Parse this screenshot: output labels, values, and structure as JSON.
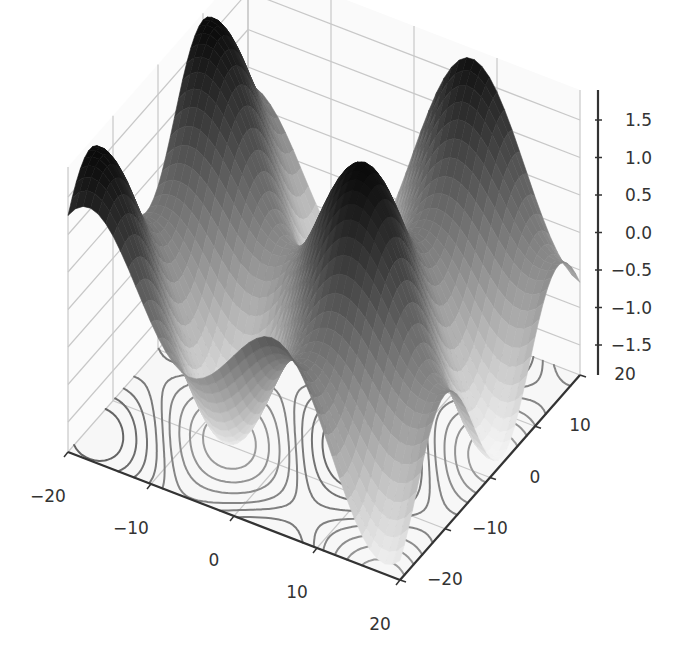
{
  "chart_data": {
    "type": "surface3d",
    "title": "",
    "xlabel": "",
    "ylabel": "",
    "zlabel": "",
    "colormap": "Greys (gray surface, dark = high, light = low)",
    "function_description": "Periodic surface z ≈ sin(x/4 ...)+cos(y/4 ...) style, peaks near ±1.8, with contour lines projected onto the floor",
    "xlim": [
      -20,
      20
    ],
    "ylim": [
      -20,
      20
    ],
    "zlim": [
      -1.9,
      1.9
    ],
    "x_ticks": [
      "−20",
      "−10",
      "0",
      "10",
      "20"
    ],
    "y_ticks": [
      "−20",
      "−10",
      "0",
      "10",
      "20"
    ],
    "z_ticks": [
      "−1.5",
      "−1.0",
      "−0.5",
      "0.0",
      "0.5",
      "1.0",
      "1.5"
    ],
    "grid": true,
    "floor_contours": true,
    "legend": null
  },
  "colors": {
    "background": "#ffffff",
    "pane": "#f7f7f7",
    "grid": "#c8c8c8",
    "axis": "#333333",
    "tick_text": "#333333"
  }
}
